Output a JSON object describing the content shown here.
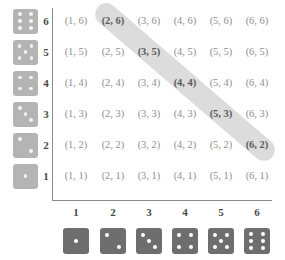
{
  "figure": {
    "kind": "dice-sample-space-grid",
    "highlight_color": "#d6d6d6",
    "die_face_color_row": "#b4b4b4",
    "die_face_color_column": "#6e6e6e",
    "pip_color": "#ffffff",
    "axis_color": "#8a8a8a",
    "cell_text_color": "#8f8f8f",
    "highlighted_cell_text_color": "#5a5a5a"
  },
  "axes": {
    "x_tick_labels": [
      "1",
      "2",
      "3",
      "4",
      "5",
      "6"
    ],
    "y_tick_labels": [
      "6",
      "5",
      "4",
      "3",
      "2",
      "1"
    ],
    "x_die_faces": [
      1,
      2,
      3,
      4,
      5,
      6
    ],
    "y_die_faces": [
      6,
      5,
      4,
      3,
      2,
      1
    ]
  },
  "grid": {
    "row_values": [
      6,
      5,
      4,
      3,
      2,
      1
    ],
    "col_values": [
      1,
      2,
      3,
      4,
      5,
      6
    ],
    "rows": [
      {
        "y": 6,
        "cells": [
          {
            "text": "(1, 6)",
            "x": 1,
            "highlighted": false
          },
          {
            "text": "(2, 6)",
            "x": 2,
            "highlighted": true
          },
          {
            "text": "(3, 6)",
            "x": 3,
            "highlighted": false
          },
          {
            "text": "(4, 6)",
            "x": 4,
            "highlighted": false
          },
          {
            "text": "(5, 6)",
            "x": 5,
            "highlighted": false
          },
          {
            "text": "(6, 6)",
            "x": 6,
            "highlighted": false
          }
        ]
      },
      {
        "y": 5,
        "cells": [
          {
            "text": "(1, 5)",
            "x": 1,
            "highlighted": false
          },
          {
            "text": "(2, 5)",
            "x": 2,
            "highlighted": false
          },
          {
            "text": "(3, 5)",
            "x": 3,
            "highlighted": true
          },
          {
            "text": "(4, 5)",
            "x": 4,
            "highlighted": false
          },
          {
            "text": "(5, 5)",
            "x": 5,
            "highlighted": false
          },
          {
            "text": "(6, 5)",
            "x": 6,
            "highlighted": false
          }
        ]
      },
      {
        "y": 4,
        "cells": [
          {
            "text": "(1, 4)",
            "x": 1,
            "highlighted": false
          },
          {
            "text": "(2, 4)",
            "x": 2,
            "highlighted": false
          },
          {
            "text": "(3, 4)",
            "x": 3,
            "highlighted": false
          },
          {
            "text": "(4, 4)",
            "x": 4,
            "highlighted": true
          },
          {
            "text": "(5, 4)",
            "x": 5,
            "highlighted": false
          },
          {
            "text": "(6, 4)",
            "x": 6,
            "highlighted": false
          }
        ]
      },
      {
        "y": 3,
        "cells": [
          {
            "text": "(1, 3)",
            "x": 1,
            "highlighted": false
          },
          {
            "text": "(2, 3)",
            "x": 2,
            "highlighted": false
          },
          {
            "text": "(3, 3)",
            "x": 3,
            "highlighted": false
          },
          {
            "text": "(4, 3)",
            "x": 4,
            "highlighted": false
          },
          {
            "text": "(5, 3)",
            "x": 5,
            "highlighted": true
          },
          {
            "text": "(6, 3)",
            "x": 6,
            "highlighted": false
          }
        ]
      },
      {
        "y": 2,
        "cells": [
          {
            "text": "(1, 2)",
            "x": 1,
            "highlighted": false
          },
          {
            "text": "(2, 2)",
            "x": 2,
            "highlighted": false
          },
          {
            "text": "(3, 2)",
            "x": 3,
            "highlighted": false
          },
          {
            "text": "(4, 2)",
            "x": 4,
            "highlighted": false
          },
          {
            "text": "(5, 2)",
            "x": 5,
            "highlighted": false
          },
          {
            "text": "(6, 2)",
            "x": 6,
            "highlighted": true
          }
        ]
      },
      {
        "y": 1,
        "cells": [
          {
            "text": "(1, 1)",
            "x": 1,
            "highlighted": false
          },
          {
            "text": "(2, 1)",
            "x": 2,
            "highlighted": false
          },
          {
            "text": "(3, 1)",
            "x": 3,
            "highlighted": false
          },
          {
            "text": "(4, 1)",
            "x": 4,
            "highlighted": false
          },
          {
            "text": "(5, 1)",
            "x": 5,
            "highlighted": false
          },
          {
            "text": "(6, 1)",
            "x": 6,
            "highlighted": false
          }
        ]
      }
    ]
  },
  "highlight": {
    "label": "anti-diagonal-sum-8",
    "cells": [
      "(2, 6)",
      "(3, 5)",
      "(4, 4)",
      "(5, 3)",
      "(6, 2)"
    ]
  }
}
